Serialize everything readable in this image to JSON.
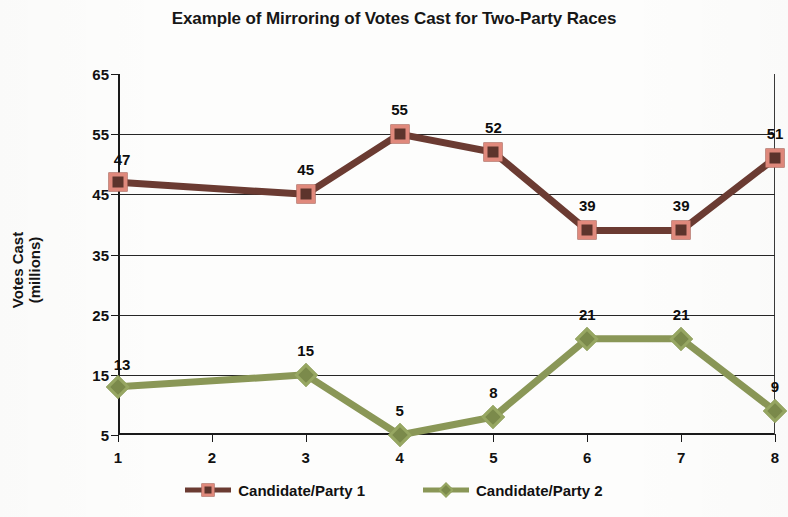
{
  "chart_data": {
    "type": "line",
    "title": "Example of Mirroring of Votes Cast for Two-Party Races",
    "xlabel": "",
    "ylabel": "Votes Cast\n(millions)",
    "ylabel_line1": "Votes Cast",
    "ylabel_line2": "(millions)",
    "x": [
      1,
      2,
      3,
      4,
      5,
      6,
      7,
      8
    ],
    "categories": [
      "1",
      "2",
      "3",
      "4",
      "5",
      "6",
      "7",
      "8"
    ],
    "xlim": [
      1,
      8
    ],
    "ylim": [
      5,
      65
    ],
    "yticks": [
      5,
      15,
      25,
      35,
      45,
      55,
      65
    ],
    "ytick_labels": [
      "5",
      "15",
      "25",
      "35",
      "45",
      "55",
      "65"
    ],
    "xticks": [
      1,
      2,
      3,
      4,
      5,
      6,
      7,
      8
    ],
    "xtick_labels": [
      "1",
      "2",
      "3",
      "4",
      "5",
      "6",
      "7",
      "8"
    ],
    "grid": "horizontal",
    "legend_position": "bottom",
    "series": [
      {
        "name": "Candidate/Party 1",
        "color": "#6b3b32",
        "marker": "square",
        "marker_fill": "#5d342c",
        "marker_edge": "#e0897c",
        "x": [
          1,
          3,
          4,
          5,
          6,
          7,
          8
        ],
        "values": [
          47,
          45,
          55,
          52,
          39,
          39,
          51
        ],
        "labels": [
          "47",
          "45",
          "55",
          "52",
          "39",
          "39",
          "51"
        ]
      },
      {
        "name": "Candidate/Party 2",
        "color": "#8a9757",
        "marker": "diamond",
        "marker_fill": "#7b8a4b",
        "marker_edge": "#97a762",
        "x": [
          1,
          3,
          4,
          5,
          6,
          7,
          8
        ],
        "values": [
          13,
          15,
          5,
          8,
          21,
          21,
          9
        ],
        "labels": [
          "13",
          "15",
          "5",
          "8",
          "21",
          "21",
          "9"
        ]
      }
    ]
  },
  "legend": {
    "items": [
      {
        "label": "Candidate/Party 1"
      },
      {
        "label": "Candidate/Party 2"
      }
    ]
  }
}
